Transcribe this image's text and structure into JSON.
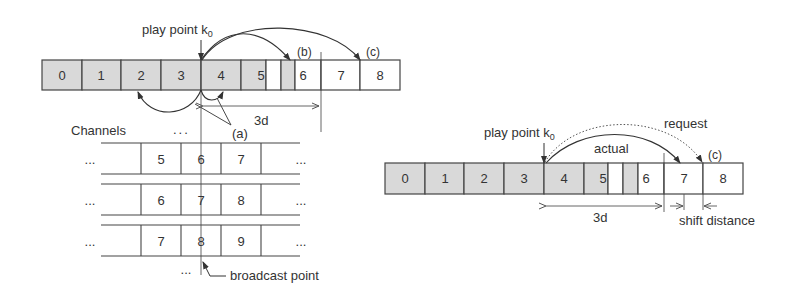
{
  "left_diagram": {
    "play_point_label": "play point k",
    "play_point_sub": "0",
    "label_a": "(a)",
    "label_b": "(b)",
    "label_c": "(c)",
    "label_3d": "3d",
    "channels_label": "Channels",
    "ellipsis": "...",
    "broadcast_label": "broadcast point",
    "strip_cells": [
      {
        "label": "0",
        "shaded": true
      },
      {
        "label": "1",
        "shaded": true
      },
      {
        "label": "2",
        "shaded": true
      },
      {
        "label": "3",
        "shaded": true
      },
      {
        "label": "4",
        "shaded": true
      },
      {
        "label": "5",
        "shaded": true
      },
      {
        "label": "6",
        "shaded": false
      },
      {
        "label": "7",
        "shaded": false
      },
      {
        "label": "8",
        "shaded": false
      }
    ],
    "channel_rows": [
      [
        "5",
        "6",
        "7"
      ],
      [
        "6",
        "7",
        "8"
      ],
      [
        "7",
        "8",
        "9"
      ]
    ]
  },
  "right_diagram": {
    "play_point_label": "play point k",
    "play_point_sub": "0",
    "label_request": "request",
    "label_actual": "actual",
    "label_c": "(c)",
    "label_3d": "3d",
    "label_shift": "shift distance",
    "strip_cells": [
      {
        "label": "0",
        "shaded": true
      },
      {
        "label": "1",
        "shaded": true
      },
      {
        "label": "2",
        "shaded": true
      },
      {
        "label": "3",
        "shaded": true
      },
      {
        "label": "4",
        "shaded": true
      },
      {
        "label": "5",
        "shaded": true
      },
      {
        "label": "6",
        "shaded": false
      },
      {
        "label": "7",
        "shaded": false
      },
      {
        "label": "8",
        "shaded": false
      }
    ]
  },
  "colors": {
    "shade": "#d9d9d9",
    "line": "#444444",
    "text": "#333333"
  }
}
